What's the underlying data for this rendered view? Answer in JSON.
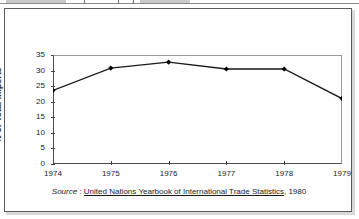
{
  "chart_data": {
    "type": "line",
    "title": "",
    "xlabel": "",
    "ylabel": "% of Total Imports",
    "categories": [
      "1974",
      "1975",
      "1976",
      "1977",
      "1978",
      "1979"
    ],
    "values": [
      23.6,
      30.8,
      32.7,
      30.5,
      30.5,
      21.0
    ],
    "series": [
      {
        "name": "% of Total Imports",
        "values": [
          23.6,
          30.8,
          32.7,
          30.5,
          30.5,
          21.0
        ]
      }
    ],
    "x": [
      1974,
      1975,
      1976,
      1977,
      1978,
      1979
    ],
    "ylim": [
      0,
      35
    ],
    "yticks": [
      "0",
      "5",
      "10",
      "15",
      "20",
      "25",
      "30",
      "35"
    ],
    "ytick_values": [
      0,
      5,
      10,
      15,
      20,
      25,
      30,
      35
    ],
    "xticks": [
      "1974",
      "1975",
      "1976",
      "1977",
      "1978",
      "1979"
    ],
    "grid": false,
    "legend": "none",
    "marker": "diamond",
    "line_color": "#1a1a1a",
    "marker_color": "#000000",
    "axis_color": "#4d4d4d"
  },
  "source": {
    "prefix_label": "Source",
    "separator": " : ",
    "title": "United Nations Yearbook of International Trade Statistics",
    "suffix": ", 1980"
  }
}
